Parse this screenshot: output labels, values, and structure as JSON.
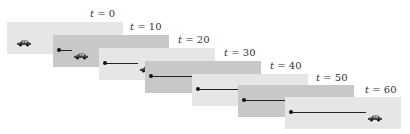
{
  "diagram": {
    "title": "",
    "panel_colors": [
      "#e6e6e6",
      "#c8c8c8"
    ],
    "frames": [
      {
        "t_label": "t",
        "eq": "= 0",
        "time": 0,
        "left": 7,
        "top": 22,
        "shade": 0,
        "label_left": 90,
        "label_top": 8,
        "car_x": 9,
        "dot": false,
        "line_len": 0
      },
      {
        "t_label": "t",
        "eq": "= 10",
        "time": 10,
        "left": 53,
        "top": 35,
        "shade": 1,
        "label_left": 130,
        "label_top": 21,
        "car_x": 20,
        "dot": true,
        "line_len": 12
      },
      {
        "t_label": "t",
        "eq": "= 20",
        "time": 20,
        "left": 99,
        "top": 48,
        "shade": 0,
        "label_left": 178,
        "label_top": 34,
        "car_x": 40,
        "dot": true,
        "line_len": 32
      },
      {
        "t_label": "t",
        "eq": "= 30",
        "time": 30,
        "left": 145,
        "top": 61,
        "shade": 1,
        "label_left": 224,
        "label_top": 47,
        "car_x": 60,
        "dot": true,
        "line_len": 52
      },
      {
        "t_label": "t",
        "eq": "= 40",
        "time": 40,
        "left": 192,
        "top": 74,
        "shade": 0,
        "label_left": 270,
        "label_top": 60,
        "car_x": 74,
        "dot": true,
        "line_len": 66
      },
      {
        "t_label": "t",
        "eq": "= 50",
        "time": 50,
        "left": 238,
        "top": 85,
        "shade": 1,
        "label_left": 316,
        "label_top": 72,
        "car_x": 66,
        "dot": true,
        "line_len": 58
      },
      {
        "t_label": "t",
        "eq": "= 60",
        "time": 60,
        "left": 285,
        "top": 97,
        "shade": 0,
        "label_left": 365,
        "label_top": 84,
        "car_x": 82,
        "dot": true,
        "line_len": 74
      }
    ]
  }
}
